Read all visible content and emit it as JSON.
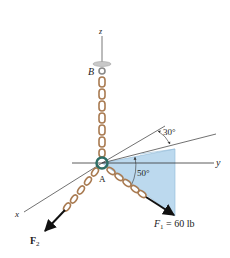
{
  "figure": {
    "axes": {
      "x_label": "x",
      "y_label": "y",
      "z_label": "z"
    },
    "points": {
      "A": "A",
      "B": "B"
    },
    "angles": {
      "alpha": "30°",
      "beta": "50°"
    },
    "forces": {
      "F1_name": "F",
      "F1_sub": "1",
      "F1_value": " = 60 lb",
      "F2_name": "F",
      "F2_sub": "2"
    },
    "colors": {
      "chain": "#b98a5e",
      "chain_dark": "#7a5a3a",
      "plane_fill": "#bcd9ee",
      "plane_stroke": "#8fb8d6",
      "ring": "#2f6e66",
      "arrow": "#111111"
    }
  }
}
